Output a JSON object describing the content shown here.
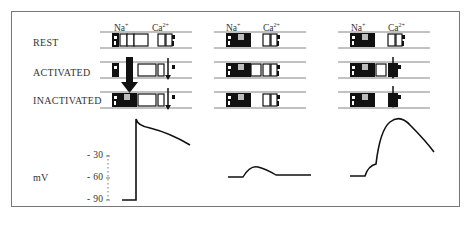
{
  "figure": {
    "state_labels": [
      "REST",
      "ACTIVATED",
      "INACTIVATED"
    ],
    "ion_labels": {
      "na": "Na",
      "na_charge": "+",
      "ca": "Ca",
      "ca_charge": "2+"
    },
    "y_axis": {
      "unit": "mV",
      "ticks": [
        "- 30",
        "- 60",
        "- 90"
      ]
    },
    "panels": [
      {
        "id": "panel-1",
        "description": "Normal action potential: Na+ channels open then inactivate; Ca2+ channels sustain plateau"
      },
      {
        "id": "panel-2",
        "description": "Na+ channels inactivated, Ca2+ channels closed: small subthreshold bump"
      },
      {
        "id": "panel-3",
        "description": "Na+ channels inactivated, Ca2+ channels activated: slow Ca2+-dependent response"
      }
    ],
    "colors": {
      "ink": "#1a1a1a",
      "line": "#555555",
      "frame": "#777777"
    }
  }
}
